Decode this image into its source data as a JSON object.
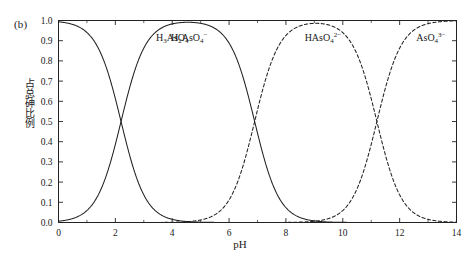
{
  "panel": {
    "tag": "(b)"
  },
  "axes": {
    "x_title": "pH",
    "y_title": "占总砷比例"
  },
  "chart_data": {
    "type": "line",
    "title": "",
    "xlabel": "pH",
    "ylabel": "占总砷比例",
    "xlim": [
      0,
      14
    ],
    "ylim": [
      0.0,
      1.0
    ],
    "grid": false,
    "legend": "none (curves labelled in-place)",
    "x_ticks": [
      0,
      2,
      4,
      6,
      8,
      10,
      12,
      14
    ],
    "x_tick_labels": [
      "0",
      "2",
      "4",
      "6",
      "8",
      "10",
      "12",
      "14"
    ],
    "x_minor_tick_step": 1,
    "y_ticks": [
      0.0,
      0.1,
      0.2,
      0.3,
      0.4,
      0.5,
      0.6,
      0.7,
      0.8,
      0.9,
      1.0
    ],
    "y_tick_labels": [
      "0.0",
      "0.1",
      "0.2",
      "0.3",
      "0.4",
      "0.5",
      "0.6",
      "0.7",
      "0.8",
      "0.9",
      "1.0"
    ],
    "pka_values": [
      2.2,
      6.9,
      11.2
    ],
    "crossover_points": [
      {
        "pH": 2.2,
        "fraction": 0.5,
        "species": [
          "H3AsO4",
          "H2AsO4-"
        ]
      },
      {
        "pH": 6.9,
        "fraction": 0.5,
        "species": [
          "H2AsO4-",
          "HAsO4 2-"
        ]
      },
      {
        "pH": 11.2,
        "fraction": 0.5,
        "species": [
          "HAsO4 2-",
          "AsO4 3-"
        ]
      }
    ],
    "series": [
      {
        "name": "H3AsO4",
        "label_main": "H",
        "label_sub1": "3",
        "label_mid": "AsO",
        "label_sub2": "4",
        "label_sup": "",
        "style": "solid",
        "color": "#222222",
        "label_x": 4.0,
        "label_y": 0.9,
        "x": [
          0,
          0.5,
          1.0,
          1.5,
          2.0,
          2.2,
          2.5,
          3.0,
          3.5,
          4.0,
          4.5,
          5.0,
          5.5,
          6.0,
          7.0,
          8.0,
          9.0,
          10.0,
          11.0,
          12.0,
          13.0,
          14.0
        ],
        "values": [
          0.994,
          0.98,
          0.941,
          0.833,
          0.613,
          0.5,
          0.334,
          0.137,
          0.048,
          0.016,
          0.005,
          0.0016,
          0.0005,
          0.0002,
          0.0,
          0.0,
          0.0,
          0.0,
          0.0,
          0.0,
          0.0,
          0.0
        ]
      },
      {
        "name": "H2AsO4-",
        "label_main": "H",
        "label_sub1": "2",
        "label_mid": "AsO",
        "label_sub2": "4",
        "label_sup": "−",
        "style": "solid",
        "color": "#222222",
        "label_x": 4.6,
        "label_y": 0.9,
        "x": [
          0,
          0.5,
          1.0,
          1.5,
          2.0,
          2.2,
          2.5,
          3.0,
          3.5,
          4.0,
          4.5,
          5.0,
          5.5,
          6.0,
          6.5,
          6.9,
          7.5,
          8.0,
          8.5,
          9.0,
          10.0,
          11.0,
          12.0,
          13.0,
          14.0
        ],
        "values": [
          0.006,
          0.02,
          0.059,
          0.167,
          0.387,
          0.5,
          0.666,
          0.863,
          0.952,
          0.984,
          0.995,
          0.998,
          0.999,
          0.999,
          0.995,
          0.5,
          0.793,
          0.442,
          0.2,
          0.073,
          0.008,
          0.0008,
          0.0,
          0.0,
          0.0
        ]
      },
      {
        "name": "HAsO4 2-",
        "label_main": "HAsO",
        "label_sub1": "",
        "label_mid": "",
        "label_sub2": "4",
        "label_sup": "2−",
        "style": "dashed",
        "color": "#222222",
        "label_x": 9.3,
        "label_y": 0.9,
        "x": [
          0,
          2.0,
          4.0,
          5.0,
          6.0,
          6.9,
          7.5,
          8.0,
          9.0,
          10.0,
          10.5,
          11.0,
          11.2,
          11.5,
          12.0,
          12.5,
          13.0,
          13.5,
          14.0
        ],
        "values": [
          0.0,
          0.0,
          0.0001,
          0.001,
          0.011,
          0.5,
          0.79,
          0.92,
          0.985,
          0.978,
          0.93,
          0.66,
          0.5,
          0.333,
          0.137,
          0.048,
          0.016,
          0.005,
          0.0016
        ]
      },
      {
        "name": "AsO4 3-",
        "label_main": "AsO",
        "label_sub1": "",
        "label_mid": "",
        "label_sub2": "4",
        "label_sup": "3−",
        "style": "dashed",
        "color": "#222222",
        "label_x": 13.1,
        "label_y": 0.9,
        "x": [
          0,
          6.0,
          8.0,
          9.0,
          10.0,
          10.5,
          11.0,
          11.2,
          11.5,
          12.0,
          12.5,
          13.0,
          13.5,
          14.0
        ],
        "values": [
          0.0,
          0.0,
          0.0,
          0.0006,
          0.006,
          0.02,
          0.34,
          0.5,
          0.667,
          0.863,
          0.952,
          0.984,
          0.995,
          0.998
        ]
      }
    ]
  }
}
